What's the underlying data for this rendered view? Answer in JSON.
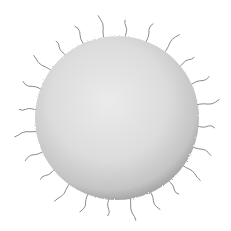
{
  "image": {
    "subject": "spherical cell with hair-like projections",
    "background": "#ffffff",
    "sphere": {
      "cx": 117,
      "cy": 118,
      "r": 82,
      "fill_light": "#e6e6e6",
      "fill_mid": "#d2d2d2",
      "fill_dark": "#a9a9a9"
    },
    "hair_color": "#8a8a8a",
    "hair_count": 24
  }
}
